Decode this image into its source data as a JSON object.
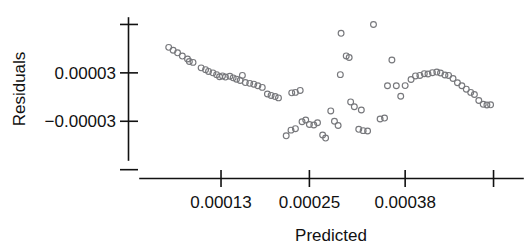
{
  "chart_data": {
    "type": "scatter",
    "title": "",
    "xlabel": "Predicted",
    "ylabel": "Residuals",
    "grid": false,
    "legend": null,
    "xlim": [
      2e-05,
      0.00054
    ],
    "ylim": [
      -7.8e-05,
      9.8e-05
    ],
    "x_ticks": [
      0.00013,
      0.00025,
      0.00038,
      0.0005
    ],
    "x_tick_labels": [
      "0.00013",
      "0.00025",
      "0.00038",
      ""
    ],
    "y_ticks": [
      9e-05,
      3e-05,
      -3e-05,
      -9e-05
    ],
    "y_tick_labels": [
      "",
      "0.00003",
      "−0.00003",
      ""
    ],
    "marker": "open-circle",
    "marker_color": "#77787c",
    "points": [
      {
        "x": 5.9e-05,
        "y": 6.16e-05
      },
      {
        "x": 6.5e-05,
        "y": 5.8e-05
      },
      {
        "x": 7.1e-05,
        "y": 5.48e-05
      },
      {
        "x": 7.75e-05,
        "y": 5.08e-05
      },
      {
        "x": 8.45e-05,
        "y": 4.72e-05
      },
      {
        "x": 8.7e-05,
        "y": 4.4e-05
      },
      {
        "x": 9.2e-05,
        "y": 4.3e-05
      },
      {
        "x": 0.000103,
        "y": 3.62e-05
      },
      {
        "x": 0.000109,
        "y": 3.4e-05
      },
      {
        "x": 0.000113,
        "y": 3.18e-05
      },
      {
        "x": 0.000119,
        "y": 3e-05
      },
      {
        "x": 0.000124,
        "y": 2.78e-05
      },
      {
        "x": 0.000128,
        "y": 2.52e-05
      },
      {
        "x": 0.000132,
        "y": 2.62e-05
      },
      {
        "x": 0.000136,
        "y": 2.48e-05
      },
      {
        "x": 0.000142,
        "y": 2.58e-05
      },
      {
        "x": 0.0001465,
        "y": 2.38e-05
      },
      {
        "x": 0.000151,
        "y": 2.22e-05
      },
      {
        "x": 0.000156,
        "y": 2.06e-05
      },
      {
        "x": 0.000163,
        "y": 1.8e-05
      },
      {
        "x": 0.000169,
        "y": 1.7e-05
      },
      {
        "x": 0.0001745,
        "y": 1.6e-05
      },
      {
        "x": 0.00018,
        "y": 1.4e-05
      },
      {
        "x": 0.000186,
        "y": 1.2e-05
      },
      {
        "x": 0.000193,
        "y": 3.8e-06
      },
      {
        "x": 0.000198,
        "y": 2e-06
      },
      {
        "x": 0.0002035,
        "y": 6e-07
      },
      {
        "x": 0.000208,
        "y": -1e-06
      },
      {
        "x": 0.000159,
        "y": 2.68e-05
      },
      {
        "x": 0.000226,
        "y": 5.2e-06
      },
      {
        "x": 0.000231,
        "y": 5.8e-06
      },
      {
        "x": 0.0002375,
        "y": 8.2e-06
      },
      {
        "x": 0.0002185,
        "y": -4.8e-05
      },
      {
        "x": 0.000225,
        "y": -4.1e-05
      },
      {
        "x": 0.000231,
        "y": -3.92e-05
      },
      {
        "x": 0.00024,
        "y": -3.06e-05
      },
      {
        "x": 0.000245,
        "y": -2.84e-05
      },
      {
        "x": 0.00025,
        "y": -3.4e-05
      },
      {
        "x": 0.000256,
        "y": -3.46e-05
      },
      {
        "x": 0.000261,
        "y": -3.18e-05
      },
      {
        "x": 0.000268,
        "y": -4.7e-05
      },
      {
        "x": 0.000272,
        "y": -5.08e-05
      },
      {
        "x": 0.000279,
        "y": -1.72e-05
      },
      {
        "x": 0.000284,
        "y": -3e-05
      },
      {
        "x": 0.000289,
        "y": -3.52e-05
      },
      {
        "x": 0.000293,
        "y": 7.9e-05
      },
      {
        "x": 0.0003,
        "y": 5.1e-05
      },
      {
        "x": 0.000304,
        "y": 4.9e-05
      },
      {
        "x": 0.000292,
        "y": 2.78e-05
      },
      {
        "x": 0.000306,
        "y": -6e-06
      },
      {
        "x": 0.000311,
        "y": -1.2e-05
      },
      {
        "x": 0.000317,
        "y": -4e-05
      },
      {
        "x": 0.000323,
        "y": -4.16e-05
      },
      {
        "x": 0.000329,
        "y": -4.2e-05
      },
      {
        "x": 0.0003205,
        "y": -1.6e-05
      },
      {
        "x": 0.000337,
        "y": 9e-05
      },
      {
        "x": 0.000346,
        "y": -2.72e-05
      },
      {
        "x": 0.000352,
        "y": -2.6e-05
      },
      {
        "x": 0.000356,
        "y": 1.4e-05
      },
      {
        "x": 0.000362,
        "y": 4.6e-05
      },
      {
        "x": 0.000368,
        "y": 1.4e-05
      },
      {
        "x": 0.000374,
        "y": 1e-06
      },
      {
        "x": 0.00038,
        "y": 1.42e-05
      },
      {
        "x": 0.000388,
        "y": 2.18e-05
      },
      {
        "x": 0.000394,
        "y": 2.62e-05
      },
      {
        "x": 0.0004,
        "y": 2.68e-05
      },
      {
        "x": 0.000406,
        "y": 2.9e-05
      },
      {
        "x": 0.000411,
        "y": 2.86e-05
      },
      {
        "x": 0.000417,
        "y": 3.02e-05
      },
      {
        "x": 0.000423,
        "y": 3.1e-05
      },
      {
        "x": 0.000428,
        "y": 2.98e-05
      },
      {
        "x": 0.000434,
        "y": 2.74e-05
      },
      {
        "x": 0.000439,
        "y": 2.68e-05
      },
      {
        "x": 0.000445,
        "y": 2.3e-05
      },
      {
        "x": 0.000451,
        "y": 1.78e-05
      },
      {
        "x": 0.000457,
        "y": 1.4e-05
      },
      {
        "x": 0.000463,
        "y": 9.8e-06
      },
      {
        "x": 0.000469,
        "y": 5.8e-06
      },
      {
        "x": 0.000474,
        "y": 3.2e-06
      },
      {
        "x": 0.00048,
        "y": -4.2e-06
      },
      {
        "x": 0.000486,
        "y": -9e-06
      },
      {
        "x": 0.000491,
        "y": -9.8e-06
      },
      {
        "x": 0.000496,
        "y": -9.6e-06
      }
    ]
  }
}
